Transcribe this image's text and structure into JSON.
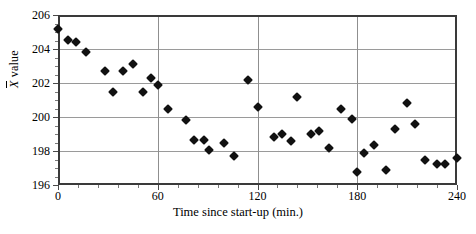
{
  "chart_data": {
    "type": "scatter",
    "title": "",
    "xlabel": "Time since start-up (min.)",
    "ylabel": "X̄ value",
    "ylabel_text": "value",
    "ylabel_symbol": "X",
    "xlim": [
      0,
      240
    ],
    "ylim": [
      196,
      206
    ],
    "xticks": [
      0,
      60,
      120,
      180,
      240
    ],
    "xtick_labels": [
      "0",
      "60",
      "120",
      "180",
      "240"
    ],
    "yticks": [
      196,
      198,
      200,
      202,
      204,
      206
    ],
    "ytick_labels": [
      "196",
      "198",
      "200",
      "202",
      "204",
      "206"
    ],
    "x_minor_step": 12,
    "y_minor_step": 0.5,
    "grid": "horizontal gridlines at each major y tick; vertical gridlines at 60, 120, 180",
    "legend": "none",
    "marker": "filled diamond",
    "marker_color": "#111111",
    "grid_color": "#9a9a9a",
    "frame_color": "#3a3a3a",
    "background": "#ffffff",
    "n_points": 44,
    "points": [
      {
        "x": 0,
        "y": 205.2
      },
      {
        "x": 6,
        "y": 204.55
      },
      {
        "x": 11,
        "y": 204.4
      },
      {
        "x": 17,
        "y": 203.8
      },
      {
        "x": 28,
        "y": 202.7
      },
      {
        "x": 33,
        "y": 201.5
      },
      {
        "x": 39,
        "y": 202.7
      },
      {
        "x": 45,
        "y": 203.1
      },
      {
        "x": 51,
        "y": 201.5
      },
      {
        "x": 56,
        "y": 202.3
      },
      {
        "x": 60,
        "y": 201.9
      },
      {
        "x": 66,
        "y": 200.5
      },
      {
        "x": 77,
        "y": 199.85
      },
      {
        "x": 82,
        "y": 198.65
      },
      {
        "x": 88,
        "y": 198.65
      },
      {
        "x": 91,
        "y": 198.05
      },
      {
        "x": 100,
        "y": 198.45
      },
      {
        "x": 106,
        "y": 197.7
      },
      {
        "x": 114,
        "y": 202.2
      },
      {
        "x": 120,
        "y": 200.6
      },
      {
        "x": 130,
        "y": 198.8
      },
      {
        "x": 135,
        "y": 199.0
      },
      {
        "x": 140,
        "y": 198.6
      },
      {
        "x": 144,
        "y": 201.15
      },
      {
        "x": 152,
        "y": 199.0
      },
      {
        "x": 157,
        "y": 199.2
      },
      {
        "x": 163,
        "y": 198.2
      },
      {
        "x": 170,
        "y": 200.5
      },
      {
        "x": 177,
        "y": 199.9
      },
      {
        "x": 180,
        "y": 196.75
      },
      {
        "x": 184,
        "y": 197.9
      },
      {
        "x": 190,
        "y": 198.35
      },
      {
        "x": 197,
        "y": 196.9
      },
      {
        "x": 203,
        "y": 199.3
      },
      {
        "x": 210,
        "y": 200.85
      },
      {
        "x": 215,
        "y": 199.6
      },
      {
        "x": 221,
        "y": 197.5
      },
      {
        "x": 228,
        "y": 197.25
      },
      {
        "x": 233,
        "y": 197.25
      },
      {
        "x": 240,
        "y": 197.6
      }
    ]
  },
  "figure": {
    "name": "x-bar control chart scatter plot"
  }
}
